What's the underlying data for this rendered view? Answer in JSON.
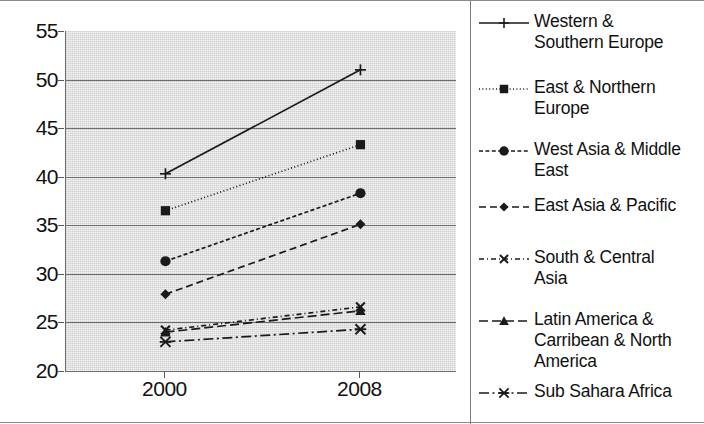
{
  "chart_data": {
    "type": "line",
    "title": "",
    "xlabel": "",
    "ylabel": "",
    "categories": [
      "2000",
      "2008"
    ],
    "x_tick_labels": [
      "2000",
      "2008"
    ],
    "y_tick_labels": [
      "20",
      "25",
      "30",
      "35",
      "40",
      "45",
      "50",
      "55"
    ],
    "y_ticks": [
      20,
      25,
      30,
      35,
      40,
      45,
      50,
      55
    ],
    "ylim": [
      20,
      55
    ],
    "grid": true,
    "grid_axis": "y",
    "legend_position": "right",
    "plot_background": "#d8d8d8",
    "line_color": "#1a1a1a",
    "series": [
      {
        "name": "Western & Southern Europe",
        "label_lines": "Western &\nSouthern Europe",
        "marker": "plus",
        "line_style": "solid",
        "values": [
          40.3,
          51.0
        ]
      },
      {
        "name": "East & Northern Europe",
        "label_lines": "East & Northern\nEurope",
        "marker": "square",
        "line_style": "dotted",
        "values": [
          36.5,
          43.3
        ]
      },
      {
        "name": "West Asia & Middle East",
        "label_lines": "West Asia & Middle\nEast",
        "marker": "circle",
        "line_style": "dash-dot-dense",
        "values": [
          31.3,
          38.3
        ]
      },
      {
        "name": "East Asia & Pacific",
        "label_lines": "East Asia & Pacific",
        "marker": "diamond",
        "line_style": "dashed",
        "values": [
          27.9,
          35.1
        ]
      },
      {
        "name": "South & Central Asia",
        "label_lines": "South & Central\nAsia",
        "marker": "x",
        "line_style": "dash-dot",
        "values": [
          24.2,
          26.6
        ]
      },
      {
        "name": "Latin America & Carribean & North America",
        "label_lines": "Latin America &\nCarribean & North\nAmerica",
        "marker": "triangle",
        "line_style": "long-dash",
        "values": [
          24.0,
          26.2
        ]
      },
      {
        "name": "Sub Sahara Africa",
        "label_lines": "Sub Sahara Africa",
        "marker": "asterisk",
        "line_style": "dash-dot-long",
        "values": [
          23.0,
          24.3
        ]
      }
    ]
  }
}
